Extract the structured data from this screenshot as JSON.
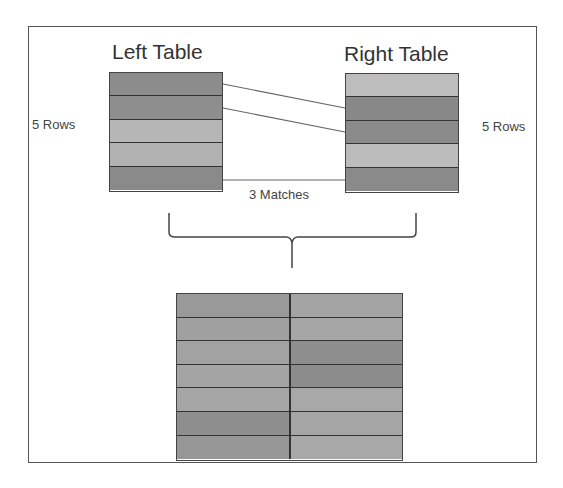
{
  "left_table": {
    "title": "Left Table",
    "rows_label": "5 Rows",
    "row_colors": [
      "#8c8c8c",
      "#8e8e8e",
      "#b6b6b6",
      "#b2b2b2",
      "#8a8a8a"
    ]
  },
  "right_table": {
    "title": "Right Table",
    "rows_label": "5 Rows",
    "row_colors": [
      "#bdbdbd",
      "#888888",
      "#8a8a8a",
      "#bcbcbc",
      "#8a8a8a"
    ]
  },
  "matches_label": "3 Matches",
  "result_table": {
    "rows": [
      [
        "#999999",
        "#a4a4a4"
      ],
      [
        "#a0a0a0",
        "#a6a6a6"
      ],
      [
        "#a2a2a2",
        "#8e8e8e"
      ],
      [
        "#a4a4a4",
        "#8c8c8c"
      ],
      [
        "#a6a6a6",
        "#a8a8a8"
      ],
      [
        "#8e8e8e",
        "#a6a6a6"
      ],
      [
        "#969696",
        "#a8a8a8"
      ]
    ]
  }
}
